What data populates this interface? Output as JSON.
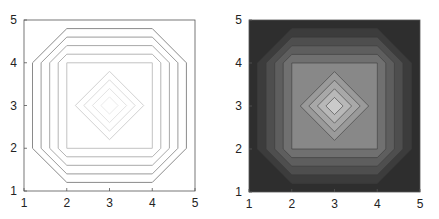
{
  "chart_data": [
    {
      "type": "contour",
      "title": "",
      "xlabel": "",
      "ylabel": "",
      "xlim": [
        1,
        5
      ],
      "ylim": [
        1,
        5
      ],
      "xticks": [
        "1",
        "2",
        "3",
        "4",
        "5"
      ],
      "yticks": [
        "1",
        "2",
        "3",
        "4",
        "5"
      ],
      "filled": false,
      "octagon_offsets": [
        0.2,
        0.4,
        0.6,
        0.8
      ],
      "square": [
        2,
        4
      ],
      "diamond_half_widths": [
        0.8,
        0.6,
        0.4,
        0.2
      ],
      "center": [
        3,
        3
      ],
      "line_colors": [
        "#8a8a8a",
        "#9a9a9a",
        "#a8a8a8",
        "#b4b4b4",
        "#c2c2c2",
        "#d2d2d2",
        "#dcdcdc",
        "#e4e4e4",
        "#ebebeb"
      ]
    },
    {
      "type": "contourf",
      "title": "",
      "xlabel": "",
      "ylabel": "",
      "xlim": [
        1,
        5
      ],
      "ylim": [
        1,
        5
      ],
      "xticks": [
        "1",
        "2",
        "3",
        "4",
        "5"
      ],
      "yticks": [
        "1",
        "2",
        "3",
        "4",
        "5"
      ],
      "filled": true,
      "octagon_offsets": [
        0.2,
        0.4,
        0.6,
        0.8
      ],
      "square": [
        2,
        4
      ],
      "diamond_half_widths": [
        0.8,
        0.6,
        0.4,
        0.2
      ],
      "center": [
        3,
        3
      ],
      "fill_colors": [
        "#2e2e2e",
        "#3c3c3c",
        "#4e4e4e",
        "#5e5e5e",
        "#707070",
        "#888888",
        "#9a9a9a",
        "#a8a8a8",
        "#b8b8b8",
        "#cacaca"
      ]
    }
  ]
}
